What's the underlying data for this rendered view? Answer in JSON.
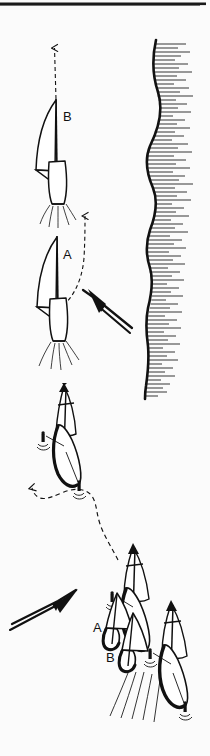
{
  "figure": {
    "kind": "line-drawing",
    "background_color": "#fbfbfb",
    "ink_color": "#111111",
    "width": 210,
    "height": 756
  },
  "top_rule": {
    "name": "top-border-rule",
    "color": "#1a1a1a"
  },
  "labels": {
    "upper_boat_b": "B",
    "upper_boat_a": "A",
    "lower_boat_a": "A",
    "lower_boat_b": "B"
  },
  "scene_upper": {
    "name": "upper-scene",
    "description": "Two sailboats seen from astern beating upwind alongside a hatched shoreline",
    "boats": [
      {
        "id": "upper-b",
        "label": "B",
        "view": "stern",
        "label_x": 66,
        "label_y": 118
      },
      {
        "id": "upper-a",
        "label": "A",
        "view": "stern",
        "label_x": 66,
        "label_y": 255
      }
    ],
    "wind_arrow": {
      "name": "wind-arrow-upper",
      "direction": "up-left",
      "style": "double-line-shaft"
    },
    "course_paths": [
      {
        "name": "course-path-b",
        "style": "dashed",
        "arrow": "up"
      },
      {
        "name": "course-path-a",
        "style": "dashed",
        "arrow": "up"
      }
    ]
  },
  "coastline": {
    "name": "coastline",
    "description": "Wavy shoreline with horizontal hatching on the landward (right) side",
    "hatch_side": "right",
    "hatch_count": 86,
    "line_color": "#111111"
  },
  "scene_lower": {
    "name": "lower-scene",
    "description": "Sailboats seen in plan/oblique view rounding a mark, with dashed course track and wake lines",
    "boats": [
      {
        "id": "lower-lead",
        "label": "",
        "view": "plan"
      },
      {
        "id": "lower-a",
        "label": "A",
        "view": "plan",
        "label_x": 96,
        "label_y": 628
      },
      {
        "id": "lower-b",
        "label": "B",
        "view": "plan",
        "label_x": 108,
        "label_y": 658
      },
      {
        "id": "lower-right",
        "label": "",
        "view": "plan"
      }
    ],
    "wind_arrow": {
      "name": "wind-arrow-lower",
      "direction": "up-right",
      "style": "double-line-shaft"
    },
    "course_path": {
      "name": "course-path-lower",
      "style": "dashed",
      "arrow": "up-left"
    },
    "wake": {
      "name": "wake-lines",
      "count": 5
    }
  }
}
